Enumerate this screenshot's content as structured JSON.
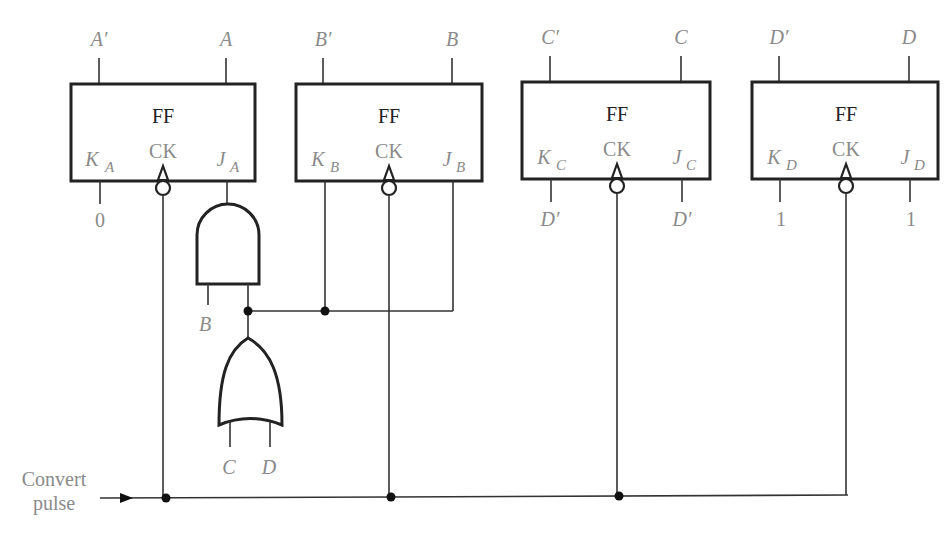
{
  "diagram": {
    "type": "sequential-logic-circuit",
    "flip_flops": [
      {
        "id": "A",
        "title": "FF",
        "clock": "CK",
        "k_label": "K",
        "k_sub": "A",
        "j_label": "J",
        "j_sub": "A",
        "out_left": "A′",
        "out_right": "A",
        "k_input": "0",
        "j_input": "AND gate output"
      },
      {
        "id": "B",
        "title": "FF",
        "clock": "CK",
        "k_label": "K",
        "k_sub": "B",
        "j_label": "J",
        "j_sub": "B",
        "out_left": "B′",
        "out_right": "B",
        "k_input": "OR gate output",
        "j_input": "OR gate output"
      },
      {
        "id": "C",
        "title": "FF",
        "clock": "CK",
        "k_label": "K",
        "k_sub": "C",
        "j_label": "J",
        "j_sub": "C",
        "out_left": "C′",
        "out_right": "C",
        "k_input": "D′",
        "j_input": "D′"
      },
      {
        "id": "D",
        "title": "FF",
        "clock": "CK",
        "k_label": "K",
        "k_sub": "D",
        "j_label": "J",
        "j_sub": "D",
        "out_left": "D′",
        "out_right": "D",
        "k_input": "1",
        "j_input": "1"
      }
    ],
    "gates": {
      "and_gate": {
        "inputs_label": "B",
        "output_to": "J_A"
      },
      "or_gate": {
        "inputs": [
          "C",
          "D"
        ],
        "output_to": "K_B, J_B, AND input"
      }
    },
    "clock_input": {
      "line1": "Convert",
      "line2": "pulse"
    }
  }
}
